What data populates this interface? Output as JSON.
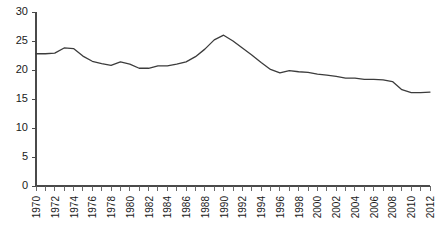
{
  "chart_data": {
    "type": "line",
    "title": "",
    "subtitle": "",
    "xlabel": "",
    "ylabel": "",
    "xlim": [
      1970,
      2012
    ],
    "ylim": [
      0,
      30
    ],
    "grid": false,
    "legend": null,
    "y_ticks": [
      0,
      5,
      10,
      15,
      20,
      25,
      30
    ],
    "y_tick_labels": [
      "0",
      "5",
      "10",
      "15",
      "20",
      "25",
      "30"
    ],
    "x_tick_labels": [
      "1970",
      "1972",
      "1974",
      "1976",
      "1978",
      "1980",
      "1982",
      "1984",
      "1986",
      "1988",
      "1990",
      "1992",
      "1994",
      "1996",
      "1998",
      "2000",
      "2002",
      "2004",
      "2006",
      "2008",
      "2010",
      "2012"
    ],
    "x_tick_label_rotation": -90,
    "x_minor_tick_every": 1,
    "x_label_every": 2,
    "line_color": "#3c3c3c",
    "x": [
      1970,
      1971,
      1972,
      1973,
      1974,
      1975,
      1976,
      1977,
      1978,
      1979,
      1980,
      1981,
      1982,
      1983,
      1984,
      1985,
      1986,
      1987,
      1988,
      1989,
      1990,
      1991,
      1992,
      1993,
      1994,
      1995,
      1996,
      1997,
      1998,
      1999,
      2000,
      2001,
      2002,
      2003,
      2004,
      2005,
      2006,
      2007,
      2008,
      2009,
      2010,
      2011,
      2012
    ],
    "values": [
      22.8,
      22.8,
      22.9,
      23.8,
      23.7,
      22.4,
      21.5,
      21.1,
      20.8,
      21.4,
      21.0,
      20.3,
      20.3,
      20.7,
      20.7,
      21.0,
      21.4,
      22.3,
      23.6,
      25.2,
      26.0,
      25.0,
      23.8,
      22.6,
      21.3,
      20.1,
      19.5,
      19.9,
      19.7,
      19.6,
      19.3,
      19.1,
      18.9,
      18.6,
      18.6,
      18.4,
      18.4,
      18.3,
      18.0,
      16.6,
      16.1,
      16.1,
      16.2
    ],
    "series": [
      {
        "name": "rate",
        "values": [
          22.8,
          22.8,
          22.9,
          23.8,
          23.7,
          22.4,
          21.5,
          21.1,
          20.8,
          21.4,
          21.0,
          20.3,
          20.3,
          20.7,
          20.7,
          21.0,
          21.4,
          22.3,
          23.6,
          25.2,
          26.0,
          25.0,
          23.8,
          22.6,
          21.3,
          20.1,
          19.5,
          19.9,
          19.7,
          19.6,
          19.3,
          19.1,
          18.9,
          18.6,
          18.6,
          18.4,
          18.4,
          18.3,
          18.0,
          16.6,
          16.1,
          16.1,
          16.2
        ]
      }
    ]
  }
}
